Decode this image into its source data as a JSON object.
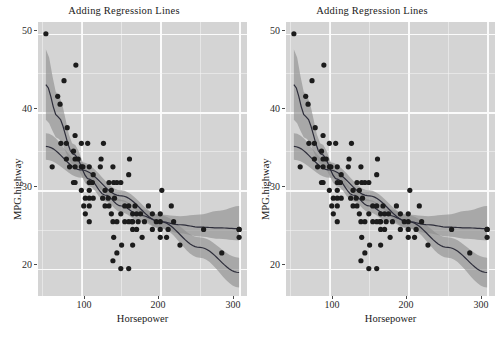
{
  "figure": {
    "width": 496,
    "height": 341,
    "background": "#ffffff",
    "panel_background": "#d4d4d4",
    "grid_color": "#f4f4f4",
    "point_color": "#1c1c1c",
    "line_color": "#2d2d3a",
    "band_color": "#8c8c8c"
  },
  "panels": [
    {
      "id": "panel-left",
      "title": "Adding Regression Lines",
      "xlabel": "Horsepower",
      "ylabel": "MPG.highway"
    },
    {
      "id": "panel-right",
      "title": "Adding Regression Lines",
      "xlabel": "Horsepower",
      "ylabel": "MPG.highway"
    }
  ],
  "chart_data": {
    "type": "scatter",
    "title": "Adding Regression Lines",
    "xlabel": "Horsepower",
    "ylabel": "MPG.highway",
    "xlim": [
      45,
      310
    ],
    "ylim": [
      16.5,
      51.5
    ],
    "xticks": [
      100,
      200,
      300
    ],
    "yticks": [
      20,
      30,
      40,
      50
    ],
    "grid": true,
    "legend": "none",
    "n_panels": 2,
    "panels_identical": true,
    "series": [
      {
        "name": "Horsepower vs MPG.highway",
        "x": [
          55,
          63,
          70,
          73,
          74,
          78,
          81,
          81,
          82,
          85,
          90,
          90,
          92,
          92,
          92,
          92,
          93,
          96,
          100,
          100,
          100,
          102,
          103,
          105,
          105,
          108,
          110,
          110,
          110,
          110,
          110,
          110,
          114,
          115,
          115,
          124,
          125,
          127,
          128,
          130,
          130,
          134,
          135,
          135,
          138,
          138,
          140,
          140,
          140,
          141,
          141,
          142,
          145,
          145,
          145,
          150,
          150,
          150,
          151,
          155,
          155,
          160,
          160,
          160,
          160,
          161,
          164,
          165,
          165,
          165,
          165,
          168,
          170,
          170,
          172,
          175,
          177,
          180,
          185,
          190,
          190,
          195,
          200,
          200,
          200,
          200,
          202,
          208,
          210,
          214,
          217,
          225,
          255,
          278,
          300,
          300,
          300
        ],
        "y": [
          50,
          33,
          42,
          41,
          36,
          44,
          36,
          34,
          38,
          33,
          35,
          31,
          33,
          34,
          37,
          31,
          46,
          34,
          36,
          33,
          30,
          33,
          28,
          29,
          27,
          36,
          30,
          31,
          29,
          33,
          28,
          26,
          31,
          32,
          29,
          33,
          34,
          29,
          36,
          30,
          28,
          29,
          28,
          31,
          27,
          30,
          33,
          26,
          21,
          31,
          24,
          29,
          26,
          22,
          31,
          31,
          27,
          20,
          23,
          26,
          28,
          32,
          28,
          26,
          20,
          34,
          26,
          26,
          27,
          25,
          23,
          28,
          27,
          25,
          26,
          27,
          24,
          26,
          28,
          27,
          25,
          26,
          26,
          25,
          24,
          27,
          30,
          24,
          25,
          28,
          26,
          23,
          25,
          22,
          25,
          25,
          24
        ]
      }
    ],
    "fits": [
      {
        "name": "linear-fit",
        "method": "lm",
        "description": "straight declining regression line with confidence band",
        "x": [
          55,
          100,
          150,
          200,
          250,
          300
        ],
        "y": [
          35.6,
          32.6,
          29.3,
          26.0,
          22.7,
          19.5
        ],
        "ci_lower": [
          33.9,
          31.6,
          28.6,
          25.2,
          21.4,
          17.6
        ],
        "ci_upper": [
          37.3,
          33.6,
          30.0,
          26.8,
          24.0,
          21.4
        ]
      },
      {
        "name": "smooth-fit",
        "method": "loess",
        "description": "curved loess smoother with confidence band",
        "x": [
          55,
          70,
          90,
          110,
          130,
          150,
          175,
          200,
          225,
          250,
          275,
          300
        ],
        "y": [
          43.5,
          39.4,
          34.6,
          31.4,
          29.4,
          28.0,
          26.8,
          26.0,
          25.6,
          25.3,
          25.2,
          25.1
        ],
        "ci_lower": [
          39.0,
          36.6,
          33.3,
          30.5,
          28.6,
          27.2,
          26.0,
          25.1,
          24.5,
          24.1,
          23.8,
          23.6
        ],
        "ci_upper": [
          48.0,
          42.2,
          35.9,
          32.3,
          30.2,
          28.8,
          27.6,
          26.9,
          26.7,
          26.9,
          27.4,
          28.0
        ]
      }
    ]
  }
}
